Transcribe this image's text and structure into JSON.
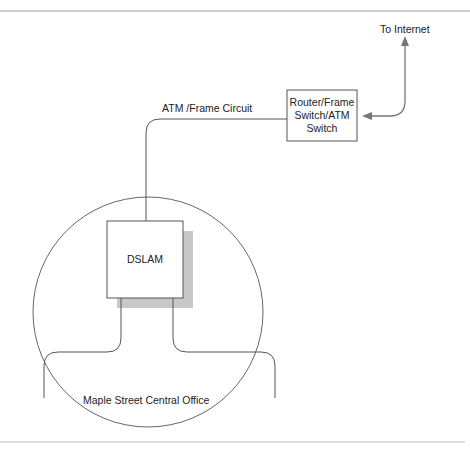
{
  "diagram": {
    "labels": {
      "to_internet": "To Internet",
      "circuit": "ATM /Frame Circuit",
      "central_office": "Maple Street Central Office"
    },
    "nodes": {
      "router": {
        "line1": "Router/Frame",
        "line2": "Switch/ATM",
        "line3": "Switch"
      },
      "dslam": {
        "label": "DSLAM"
      }
    },
    "colors": {
      "line": "#555555",
      "arrow": "#777777",
      "shadow": "#c8c8c8",
      "rule": "#999999"
    }
  }
}
